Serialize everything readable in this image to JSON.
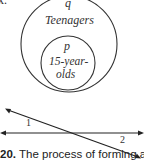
{
  "top_fragment": "x.",
  "venn": {
    "outer": {
      "letter": "q",
      "label": "Teenagers"
    },
    "inner": {
      "letter": "p",
      "label_line1": "15-year-",
      "label_line2": "olds"
    }
  },
  "lines_figure": {
    "angle_1_label": "1",
    "angle_2_label": "2"
  },
  "caption": {
    "number": "20.",
    "text": " The process of forming a"
  },
  "colors": {
    "stroke": "#333333",
    "text": "#222222",
    "background": "#ffffff"
  }
}
